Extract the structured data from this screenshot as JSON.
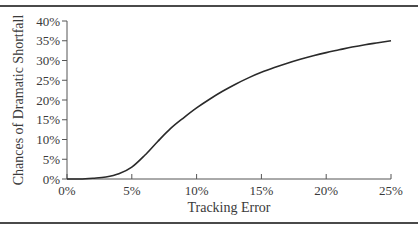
{
  "chart_data": {
    "type": "line",
    "title": "",
    "xlabel": "Tracking Error",
    "ylabel": "Chances of Dramatic Shortfall",
    "xlim": [
      0,
      25
    ],
    "ylim": [
      0,
      40
    ],
    "x_ticks": [
      "0%",
      "5%",
      "10%",
      "15%",
      "20%",
      "25%"
    ],
    "y_ticks": [
      "0%",
      "5%",
      "10%",
      "15%",
      "20%",
      "25%",
      "30%",
      "35%",
      "40%"
    ],
    "grid": false,
    "legend": null,
    "series": [
      {
        "name": "Chances of Dramatic Shortfall",
        "color": "#2a2a2a",
        "x": [
          0,
          1,
          2,
          3,
          4,
          5,
          6,
          7,
          8,
          9,
          10,
          11,
          12,
          13,
          14,
          15,
          16,
          17,
          18,
          19,
          20,
          21,
          22,
          23,
          24,
          25
        ],
        "y": [
          0.0,
          0.0,
          0.2,
          0.5,
          1.3,
          3.0,
          6.0,
          9.5,
          12.8,
          15.5,
          18.0,
          20.2,
          22.2,
          24.0,
          25.6,
          27.0,
          28.2,
          29.3,
          30.3,
          31.2,
          32.0,
          32.7,
          33.4,
          34.0,
          34.5,
          35.0
        ]
      }
    ]
  }
}
